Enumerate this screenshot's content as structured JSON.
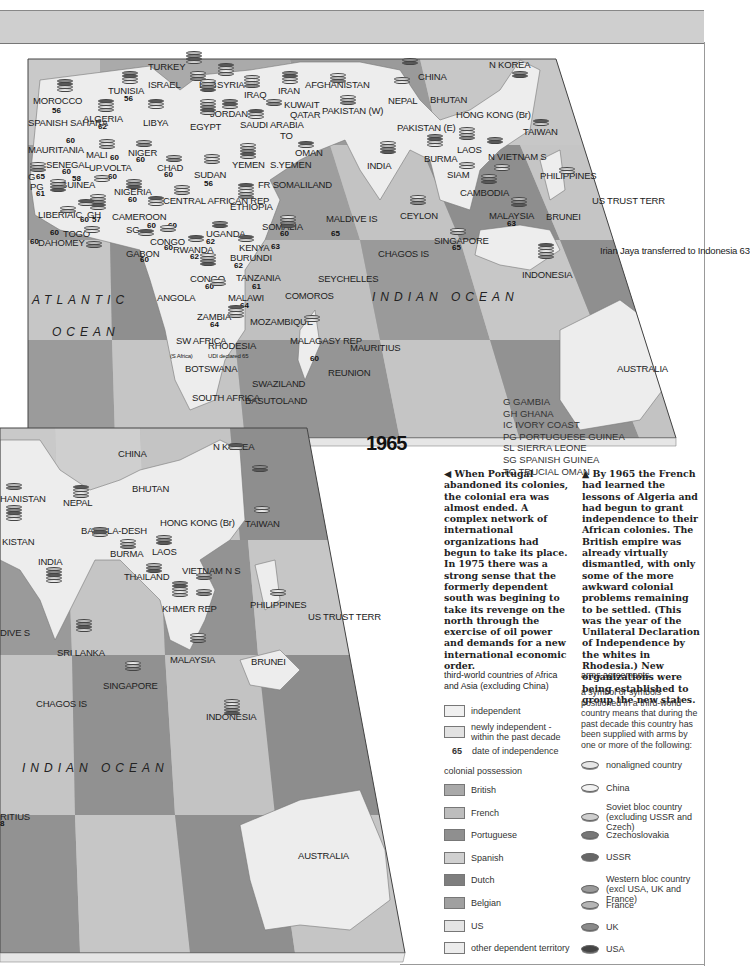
{
  "header": {
    "band": ""
  },
  "year_label": "1965",
  "upper_map": {
    "countries": [
      {
        "name": "TURKEY",
        "x": 148,
        "y": 62
      },
      {
        "name": "ISRAEL",
        "x": 148,
        "y": 80
      },
      {
        "name": "LEB",
        "x": 199,
        "y": 80
      },
      {
        "name": "SYRIA",
        "x": 217,
        "y": 80
      },
      {
        "name": "IRAQ",
        "x": 244,
        "y": 90
      },
      {
        "name": "IRAN",
        "x": 278,
        "y": 86
      },
      {
        "name": "AFGHANISTAN",
        "x": 305,
        "y": 80
      },
      {
        "name": "KUWAIT",
        "x": 284,
        "y": 100
      },
      {
        "name": "QATAR",
        "x": 290,
        "y": 110
      },
      {
        "name": "PAKISTAN (W)",
        "x": 322,
        "y": 106
      },
      {
        "name": "MOROCCO",
        "x": 33,
        "y": 96
      },
      {
        "name": "TUNISIA",
        "x": 108,
        "y": 86
      },
      {
        "name": "ALGERIA",
        "x": 83,
        "y": 114
      },
      {
        "name": "LIBYA",
        "x": 143,
        "y": 118
      },
      {
        "name": "EGYPT",
        "x": 190,
        "y": 122
      },
      {
        "name": "JORDAN",
        "x": 210,
        "y": 109
      },
      {
        "name": "SAUDI ARABIA",
        "x": 240,
        "y": 120
      },
      {
        "name": "TO",
        "x": 280,
        "y": 131
      },
      {
        "name": "SPANISH SAHARA",
        "x": 28,
        "y": 118
      },
      {
        "name": "MAURITANIA",
        "x": 28,
        "y": 145
      },
      {
        "name": "MALI",
        "x": 86,
        "y": 150
      },
      {
        "name": "NIGER",
        "x": 128,
        "y": 148
      },
      {
        "name": "OMAN",
        "x": 295,
        "y": 148
      },
      {
        "name": "YEMEN",
        "x": 232,
        "y": 160
      },
      {
        "name": "S.YEMEN",
        "x": 270,
        "y": 160
      },
      {
        "name": "SENEGAL",
        "x": 46,
        "y": 160
      },
      {
        "name": "UP.VOLTA",
        "x": 89,
        "y": 163
      },
      {
        "name": "CHAD",
        "x": 157,
        "y": 163
      },
      {
        "name": "SUDAN",
        "x": 194,
        "y": 170
      },
      {
        "name": "G",
        "x": 28,
        "y": 172
      },
      {
        "name": "PG",
        "x": 30,
        "y": 182
      },
      {
        "name": "GUINEA",
        "x": 60,
        "y": 180
      },
      {
        "name": "FR SOMALILAND",
        "x": 258,
        "y": 180
      },
      {
        "name": "NIGERIA",
        "x": 114,
        "y": 187
      },
      {
        "name": "CENTRAL AFRICAN REP",
        "x": 163,
        "y": 196
      },
      {
        "name": "ETHIOPIA",
        "x": 230,
        "y": 202
      },
      {
        "name": "LIBERIA",
        "x": 38,
        "y": 210
      },
      {
        "name": "IC",
        "x": 73,
        "y": 210
      },
      {
        "name": "GH",
        "x": 87,
        "y": 210
      },
      {
        "name": "CAMEROON",
        "x": 112,
        "y": 212
      },
      {
        "name": "SOMALIA",
        "x": 262,
        "y": 222
      },
      {
        "name": "MALDIVE IS",
        "x": 326,
        "y": 214
      },
      {
        "name": "SG",
        "x": 126,
        "y": 225
      },
      {
        "name": "TOGO",
        "x": 63,
        "y": 229
      },
      {
        "name": "DAHOMEY",
        "x": 38,
        "y": 238
      },
      {
        "name": "CONGO",
        "x": 150,
        "y": 237
      },
      {
        "name": "UGANDA",
        "x": 206,
        "y": 229
      },
      {
        "name": "KENYA",
        "x": 239,
        "y": 243
      },
      {
        "name": "GABON",
        "x": 126,
        "y": 249
      },
      {
        "name": "RWANDA",
        "x": 173,
        "y": 245
      },
      {
        "name": "BURUNDI",
        "x": 230,
        "y": 253
      },
      {
        "name": "CONGO",
        "x": 190,
        "y": 274
      },
      {
        "name": "TANZANIA",
        "x": 236,
        "y": 273
      },
      {
        "name": "SEYCHELLES",
        "x": 318,
        "y": 274
      },
      {
        "name": "ANGOLA",
        "x": 157,
        "y": 293
      },
      {
        "name": "MALAWI",
        "x": 228,
        "y": 293
      },
      {
        "name": "COMOROS",
        "x": 285,
        "y": 291
      },
      {
        "name": "ZAMBIA",
        "x": 197,
        "y": 312
      },
      {
        "name": "MOZAMBIQUE",
        "x": 250,
        "y": 317
      },
      {
        "name": "SW AFRICA",
        "x": 176,
        "y": 336
      },
      {
        "name": "RHODESIA",
        "x": 208,
        "y": 341
      },
      {
        "name": "MALAGASY REP",
        "x": 290,
        "y": 336
      },
      {
        "name": "MAURITIUS",
        "x": 350,
        "y": 343
      },
      {
        "name": "BOTSWANA",
        "x": 185,
        "y": 364
      },
      {
        "name": "REUNION",
        "x": 328,
        "y": 368
      },
      {
        "name": "SWAZILAND",
        "x": 252,
        "y": 379
      },
      {
        "name": "SOUTH AFRICA",
        "x": 192,
        "y": 393
      },
      {
        "name": "BASUTOLAND",
        "x": 245,
        "y": 396
      },
      {
        "name": "CHINA",
        "x": 418,
        "y": 72
      },
      {
        "name": "N KOREA",
        "x": 489,
        "y": 60
      },
      {
        "name": "NEPAL",
        "x": 388,
        "y": 96
      },
      {
        "name": "BHUTAN",
        "x": 430,
        "y": 95
      },
      {
        "name": "PAKISTAN (E)",
        "x": 397,
        "y": 123
      },
      {
        "name": "HONG KONG (Br)",
        "x": 456,
        "y": 110
      },
      {
        "name": "TAIWAN",
        "x": 523,
        "y": 127
      },
      {
        "name": "INDIA",
        "x": 367,
        "y": 161
      },
      {
        "name": "BURMA",
        "x": 424,
        "y": 154
      },
      {
        "name": "LAOS",
        "x": 457,
        "y": 145
      },
      {
        "name": "N VIETNAM S",
        "x": 488,
        "y": 152
      },
      {
        "name": "SIAM",
        "x": 447,
        "y": 170
      },
      {
        "name": "CAMBODIA",
        "x": 460,
        "y": 188
      },
      {
        "name": "PHILIPPINES",
        "x": 540,
        "y": 171
      },
      {
        "name": "US TRUST TERR",
        "x": 592,
        "y": 196
      },
      {
        "name": "CEYLON",
        "x": 400,
        "y": 211
      },
      {
        "name": "MALAYSIA",
        "x": 489,
        "y": 211
      },
      {
        "name": "BRUNEI",
        "x": 546,
        "y": 212
      },
      {
        "name": "CHAGOS IS",
        "x": 378,
        "y": 249
      },
      {
        "name": "SINGAPORE",
        "x": 434,
        "y": 236
      },
      {
        "name": "INDONESIA",
        "x": 522,
        "y": 270
      },
      {
        "name": "Irian Jaya transferred to Indonesia 63",
        "x": 600,
        "y": 246
      },
      {
        "name": "AUSTRALIA",
        "x": 617,
        "y": 364
      }
    ],
    "oceans": [
      {
        "name": "ATLANTIC",
        "x": 32,
        "y": 294
      },
      {
        "name": "OCEAN",
        "x": 52,
        "y": 326
      },
      {
        "name": "INDIAN OCEAN",
        "x": 372,
        "y": 291
      }
    ],
    "dates": [
      {
        "v": "56",
        "x": 52,
        "y": 107
      },
      {
        "v": "56",
        "x": 124,
        "y": 95
      },
      {
        "v": "62",
        "x": 98,
        "y": 123
      },
      {
        "v": "60",
        "x": 66,
        "y": 137
      },
      {
        "v": "60",
        "x": 110,
        "y": 154
      },
      {
        "v": "60",
        "x": 136,
        "y": 156
      },
      {
        "v": "60",
        "x": 164,
        "y": 171
      },
      {
        "v": "56",
        "x": 204,
        "y": 180
      },
      {
        "v": "65",
        "x": 36,
        "y": 173
      },
      {
        "v": "60",
        "x": 62,
        "y": 168
      },
      {
        "v": "58",
        "x": 72,
        "y": 175
      },
      {
        "v": "60",
        "x": 108,
        "y": 173
      },
      {
        "v": "61",
        "x": 36,
        "y": 190
      },
      {
        "v": "60",
        "x": 128,
        "y": 196
      },
      {
        "v": "60",
        "x": 80,
        "y": 216
      },
      {
        "v": "57",
        "x": 92,
        "y": 216
      },
      {
        "v": "60",
        "x": 147,
        "y": 222
      },
      {
        "v": "60",
        "x": 168,
        "y": 222
      },
      {
        "v": "60",
        "x": 50,
        "y": 229
      },
      {
        "v": "60",
        "x": 30,
        "y": 238
      },
      {
        "v": "60",
        "x": 164,
        "y": 244
      },
      {
        "v": "62",
        "x": 206,
        "y": 238
      },
      {
        "v": "63",
        "x": 271,
        "y": 243
      },
      {
        "v": "60",
        "x": 280,
        "y": 230
      },
      {
        "v": "65",
        "x": 331,
        "y": 230
      },
      {
        "v": "60",
        "x": 140,
        "y": 256
      },
      {
        "v": "62",
        "x": 190,
        "y": 253
      },
      {
        "v": "62",
        "x": 234,
        "y": 262
      },
      {
        "v": "60",
        "x": 205,
        "y": 283
      },
      {
        "v": "61",
        "x": 252,
        "y": 283
      },
      {
        "v": "64",
        "x": 240,
        "y": 302
      },
      {
        "v": "64",
        "x": 210,
        "y": 321
      },
      {
        "v": "60",
        "x": 310,
        "y": 355
      },
      {
        "v": "65",
        "x": 452,
        "y": 244
      },
      {
        "v": "63",
        "x": 507,
        "y": 220
      }
    ],
    "small_notes": [
      {
        "t": "(S Africa)",
        "x": 170,
        "y": 353
      },
      {
        "t": "UDI declared 65",
        "x": 208,
        "y": 353
      }
    ]
  },
  "lower_map": {
    "countries": [
      {
        "name": "HANISTAN",
        "x": 0,
        "y": 494
      },
      {
        "name": "KISTAN",
        "x": 2,
        "y": 537
      },
      {
        "name": "CHINA",
        "x": 118,
        "y": 449
      },
      {
        "name": "N KOREA",
        "x": 213,
        "y": 442
      },
      {
        "name": "NEPAL",
        "x": 63,
        "y": 498
      },
      {
        "name": "BHUTAN",
        "x": 132,
        "y": 484
      },
      {
        "name": "BANGLA-DESH",
        "x": 81,
        "y": 526
      },
      {
        "name": "HONG KONG (Br)",
        "x": 160,
        "y": 518
      },
      {
        "name": "TAIWAN",
        "x": 245,
        "y": 519
      },
      {
        "name": "INDIA",
        "x": 38,
        "y": 557
      },
      {
        "name": "BURMA",
        "x": 110,
        "y": 549
      },
      {
        "name": "LAOS",
        "x": 152,
        "y": 547
      },
      {
        "name": "THAILAND",
        "x": 124,
        "y": 572
      },
      {
        "name": "VIETNAM N S",
        "x": 182,
        "y": 566
      },
      {
        "name": "KHMER REP",
        "x": 162,
        "y": 604
      },
      {
        "name": "PHILIPPINES",
        "x": 250,
        "y": 600
      },
      {
        "name": "US TRUST TERR",
        "x": 308,
        "y": 612
      },
      {
        "name": "DIVE S",
        "x": 0,
        "y": 628
      },
      {
        "name": "SRI LANKA",
        "x": 57,
        "y": 648
      },
      {
        "name": "MALAYSIA",
        "x": 170,
        "y": 655
      },
      {
        "name": "BRUNEI",
        "x": 251,
        "y": 657
      },
      {
        "name": "SINGAPORE",
        "x": 103,
        "y": 681
      },
      {
        "name": "CHAGOS IS",
        "x": 36,
        "y": 699
      },
      {
        "name": "INDONESIA",
        "x": 206,
        "y": 712
      },
      {
        "name": "RITIUS",
        "x": 0,
        "y": 812
      },
      {
        "name": "AUSTRALIA",
        "x": 298,
        "y": 851
      }
    ],
    "oceans": [
      {
        "name": "INDIAN OCEAN",
        "x": 22,
        "y": 762
      }
    ],
    "dates": [
      {
        "v": "8",
        "x": 0,
        "y": 820
      }
    ]
  },
  "abbreviations": [
    "G GAMBIA",
    "GH GHANA",
    "IC IVORY COAST",
    "PG PORTUGUESE GUINEA",
    "SL SIERRA LEONE",
    "SG SPANISH GUINEA",
    "TO TRUCIAL OMAN"
  ],
  "captions": {
    "left": "◀ When Portugal abandoned its colonies, the colonial era was almost ended. A complex network of international organizations had begun to take its place. In 1975 there was a strong sense that the formerly dependent south was begining to take its revenge on the north through the exercise of oil power and demands for a new international economic order.",
    "right": "▲ By 1965 the French had learned the lessons of Algeria and had begun to grant independence to their African colonies. The British empire was already virtually dismantled, with only some of the more awkward colonial problems remaining to be settled. (This was the year of the Unilateral Declaration of Independence by the whites in Rhodesia.) New organizations were being established to group the new states."
  },
  "legend_left": {
    "title": "third-world countries of Africa and Asia (excluding China)",
    "items": [
      {
        "label": "independent",
        "color": "#f0f0f0"
      },
      {
        "label": "newly independent - within the past decade",
        "color": "#e2e2e2"
      }
    ],
    "date_sample": "65",
    "date_label": "date of independence",
    "colonial_title": "colonial possession",
    "colonial": [
      {
        "label": "British",
        "color": "#a9a9a9"
      },
      {
        "label": "French",
        "color": "#bdbdbd"
      },
      {
        "label": "Portuguese",
        "color": "#8f8f8f"
      },
      {
        "label": "Spanish",
        "color": "#d0d0d0"
      },
      {
        "label": "Dutch",
        "color": "#7e7e7e"
      },
      {
        "label": "Belgian",
        "color": "#a0a0a0"
      },
      {
        "label": "US",
        "color": "#e4e4e4"
      },
      {
        "label": "other dependent territory",
        "color": "#ececec"
      }
    ]
  },
  "legend_right": {
    "title": "arms agreements",
    "description": "a symbol or symbols positioned in a third-world country means that during the past decade this country has been supplied with arms by one or more of the following:",
    "items": [
      {
        "label": "nonaligned country",
        "color": "#e6e6e6"
      },
      {
        "label": "China",
        "color": "#f2f2f2"
      },
      {
        "label": "Soviet bloc country (excluding USSR and Czech)",
        "color": "#cfcfcf"
      },
      {
        "label": "Czechoslovakia",
        "color": "#777777"
      },
      {
        "label": "USSR",
        "color": "#666666"
      },
      {
        "label": "Western bloc country (excl USA, UK and France)",
        "color": "#9a9a9a"
      },
      {
        "label": "France",
        "color": "#b5b5b5"
      },
      {
        "label": "UK",
        "color": "#8a8a8a"
      },
      {
        "label": "USA",
        "color": "#444444"
      }
    ]
  },
  "colors": {
    "land_independent": "#ececec",
    "sea_light": "#c4c4c4",
    "sea_mid": "#a8a8a8",
    "sea_dark": "#8c8c8c",
    "header_band": "#cfcfcf"
  }
}
